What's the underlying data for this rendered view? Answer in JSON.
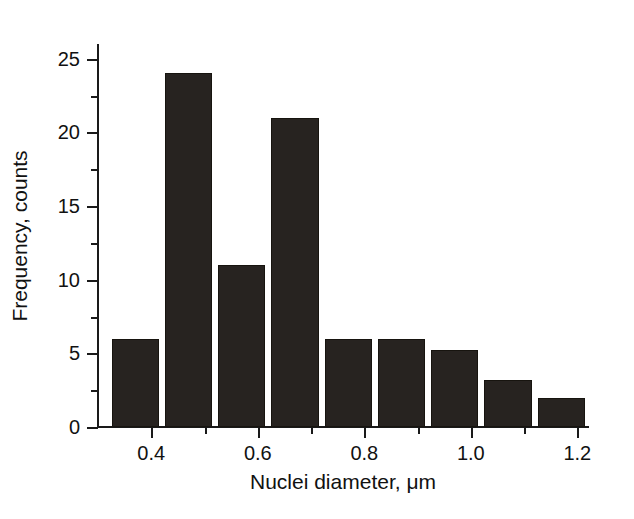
{
  "chart_data": {
    "type": "bar",
    "title": "",
    "subtitle": "",
    "xlabel": "Nuclei diameter, μm",
    "ylabel": "Frequency, counts",
    "xlim": [
      0.3,
      1.22
    ],
    "ylim": [
      0,
      26
    ],
    "grid": false,
    "legend": null,
    "bin_width": 0.1,
    "x_major_ticks": [
      0.4,
      0.6,
      0.8,
      1.0,
      1.2
    ],
    "x_major_tick_labels": [
      "0.4",
      "0.6",
      "0.8",
      "1.0",
      "1.2"
    ],
    "x_minor_ticks": [
      0.5,
      0.7,
      0.9,
      1.1
    ],
    "y_major_ticks": [
      0,
      5,
      10,
      15,
      20,
      25
    ],
    "y_major_tick_labels": [
      "0",
      "5",
      "10",
      "15",
      "20",
      "25"
    ],
    "y_minor_ticks": [
      2.5,
      7.5,
      12.5,
      17.5,
      22.5
    ],
    "bin_edges": [
      0.32,
      0.42,
      0.52,
      0.62,
      0.72,
      0.82,
      0.92,
      1.02,
      1.12,
      1.22
    ],
    "categories": [
      "0.32-0.42",
      "0.42-0.52",
      "0.52-0.62",
      "0.62-0.72",
      "0.72-0.82",
      "0.82-0.92",
      "0.92-1.02",
      "1.02-1.12",
      "1.12-1.22"
    ],
    "values": [
      6,
      24,
      11,
      21,
      6,
      6,
      5.2,
      3.2,
      2
    ],
    "bar_color": "#272320",
    "axis_color": "#1a1a1a",
    "background_color": "#ffffff"
  }
}
